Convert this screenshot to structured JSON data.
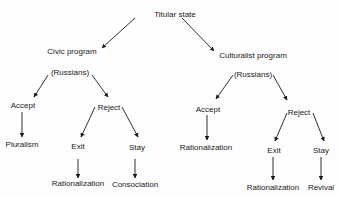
{
  "diagram": {
    "type": "tree",
    "nodes": {
      "root": {
        "label": "Titular state"
      },
      "civic": {
        "label": "Civic program"
      },
      "civic_russians": {
        "label": "(Russians)"
      },
      "civic_accept": {
        "label": "Accept"
      },
      "civic_pluralism": {
        "label": "Pluralism"
      },
      "civic_reject": {
        "label": "Reject"
      },
      "civic_exit": {
        "label": "Exit"
      },
      "civic_stay": {
        "label": "Stay"
      },
      "civic_exit_result": {
        "label": "Rationalization"
      },
      "civic_stay_result": {
        "label": "Consociation"
      },
      "cult": {
        "label": "Culturalist program"
      },
      "cult_russians": {
        "label": "(Russians)"
      },
      "cult_accept": {
        "label": "Accept"
      },
      "cult_accept_result": {
        "label": "Rationalization"
      },
      "cult_reject": {
        "label": "Reject"
      },
      "cult_exit": {
        "label": "Exit"
      },
      "cult_stay": {
        "label": "Stay"
      },
      "cult_exit_result": {
        "label": "Rationalization"
      },
      "cult_stay_result": {
        "label": "Revival"
      }
    },
    "edges": [
      [
        "root",
        "civic"
      ],
      [
        "root",
        "cult"
      ],
      [
        "civic_russians",
        "civic_accept"
      ],
      [
        "civic_russians",
        "civic_reject"
      ],
      [
        "civic_accept",
        "civic_pluralism"
      ],
      [
        "civic_reject",
        "civic_exit"
      ],
      [
        "civic_reject",
        "civic_stay"
      ],
      [
        "civic_exit",
        "civic_exit_result"
      ],
      [
        "civic_stay",
        "civic_stay_result"
      ],
      [
        "cult_russians",
        "cult_accept"
      ],
      [
        "cult_russians",
        "cult_reject"
      ],
      [
        "cult_accept",
        "cult_accept_result"
      ],
      [
        "cult_reject",
        "cult_exit"
      ],
      [
        "cult_reject",
        "cult_stay"
      ],
      [
        "cult_exit",
        "cult_exit_result"
      ],
      [
        "cult_stay",
        "cult_stay_result"
      ]
    ]
  }
}
